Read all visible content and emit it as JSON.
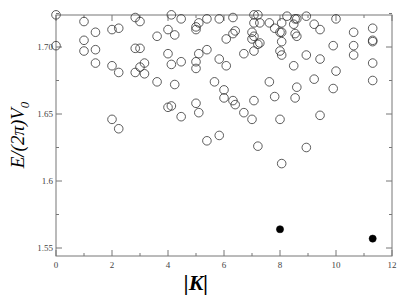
{
  "chart_data": {
    "type": "scatter",
    "title": "",
    "xlabel": "|K|",
    "ylabel": "E/(2π)V_0",
    "xlim": [
      0,
      12
    ],
    "ylim": [
      1.543,
      1.724
    ],
    "grid": false,
    "legend": null,
    "x_ticks": [
      0,
      2,
      4,
      6,
      8,
      10,
      12
    ],
    "x_tick_labels": [
      "0",
      "2",
      "4",
      "6",
      "8",
      "10",
      "12"
    ],
    "y_ticks": [
      1.55,
      1.6,
      1.65,
      1.7
    ],
    "y_tick_labels": [
      "1.55",
      "1.6",
      "1.65",
      "1.70"
    ],
    "series": [
      {
        "name": "open circles",
        "marker": "open-circle",
        "color": "#333333",
        "points": [
          [
            0.0,
            1.724
          ],
          [
            0.0,
            1.701
          ],
          [
            1.0,
            1.719
          ],
          [
            1.0,
            1.705
          ],
          [
            1.0,
            1.697
          ],
          [
            1.41,
            1.711
          ],
          [
            1.41,
            1.698
          ],
          [
            1.41,
            1.688
          ],
          [
            2.0,
            1.713
          ],
          [
            2.0,
            1.686
          ],
          [
            2.0,
            1.646
          ],
          [
            2.24,
            1.714
          ],
          [
            2.24,
            1.681
          ],
          [
            2.24,
            1.639
          ],
          [
            2.83,
            1.722
          ],
          [
            2.83,
            1.699
          ],
          [
            2.83,
            1.681
          ],
          [
            3.0,
            1.719
          ],
          [
            3.0,
            1.699
          ],
          [
            3.0,
            1.685
          ],
          [
            3.16,
            1.688
          ],
          [
            3.16,
            1.68
          ],
          [
            3.61,
            1.708
          ],
          [
            3.61,
            1.674
          ],
          [
            4.0,
            1.713
          ],
          [
            4.0,
            1.695
          ],
          [
            4.0,
            1.655
          ],
          [
            4.12,
            1.724
          ],
          [
            4.12,
            1.687
          ],
          [
            4.12,
            1.656
          ],
          [
            4.24,
            1.709
          ],
          [
            4.24,
            1.672
          ],
          [
            4.47,
            1.721
          ],
          [
            4.47,
            1.689
          ],
          [
            4.47,
            1.648
          ],
          [
            5.0,
            1.715
          ],
          [
            5.0,
            1.713
          ],
          [
            5.0,
            1.689
          ],
          [
            5.0,
            1.684
          ],
          [
            5.0,
            1.658
          ],
          [
            5.1,
            1.718
          ],
          [
            5.1,
            1.695
          ],
          [
            5.1,
            1.651
          ],
          [
            5.39,
            1.721
          ],
          [
            5.39,
            1.698
          ],
          [
            5.39,
            1.63
          ],
          [
            5.66,
            1.674
          ],
          [
            5.83,
            1.721
          ],
          [
            5.83,
            1.691
          ],
          [
            5.83,
            1.634
          ],
          [
            6.0,
            1.668
          ],
          [
            6.0,
            1.662
          ],
          [
            6.08,
            1.706
          ],
          [
            6.08,
            1.686
          ],
          [
            6.32,
            1.722
          ],
          [
            6.32,
            1.71
          ],
          [
            6.32,
            1.66
          ],
          [
            6.4,
            1.712
          ],
          [
            6.4,
            1.657
          ],
          [
            6.71,
            1.695
          ],
          [
            6.71,
            1.651
          ],
          [
            7.0,
            1.711
          ],
          [
            7.0,
            1.706
          ],
          [
            7.0,
            1.646
          ],
          [
            7.07,
            1.724
          ],
          [
            7.07,
            1.718
          ],
          [
            7.07,
            1.708
          ],
          [
            7.07,
            1.697
          ],
          [
            7.07,
            1.66
          ],
          [
            7.21,
            1.724
          ],
          [
            7.21,
            1.702
          ],
          [
            7.21,
            1.626
          ],
          [
            7.28,
            1.718
          ],
          [
            7.28,
            1.703
          ],
          [
            7.62,
            1.718
          ],
          [
            7.62,
            1.674
          ],
          [
            7.81,
            1.714
          ],
          [
            7.81,
            1.663
          ],
          [
            8.0,
            1.711
          ],
          [
            8.0,
            1.697
          ],
          [
            8.0,
            1.646
          ],
          [
            8.06,
            1.718
          ],
          [
            8.06,
            1.711
          ],
          [
            8.06,
            1.704
          ],
          [
            8.06,
            1.694
          ],
          [
            8.06,
            1.613
          ],
          [
            8.25,
            1.723
          ],
          [
            8.49,
            1.717
          ],
          [
            8.49,
            1.686
          ],
          [
            8.54,
            1.721
          ],
          [
            8.54,
            1.71
          ],
          [
            8.54,
            1.662
          ],
          [
            8.6,
            1.721
          ],
          [
            8.6,
            1.708
          ],
          [
            8.6,
            1.67
          ],
          [
            8.94,
            1.723
          ],
          [
            8.94,
            1.694
          ],
          [
            8.94,
            1.625
          ],
          [
            9.22,
            1.717
          ],
          [
            9.22,
            1.676
          ],
          [
            9.43,
            1.713
          ],
          [
            9.43,
            1.691
          ],
          [
            9.43,
            1.649
          ],
          [
            9.9,
            1.701
          ],
          [
            9.9,
            1.669
          ],
          [
            10.0,
            1.721
          ],
          [
            10.0,
            1.682
          ],
          [
            10.63,
            1.711
          ],
          [
            10.63,
            1.701
          ],
          [
            10.63,
            1.694
          ],
          [
            11.31,
            1.714
          ],
          [
            11.31,
            1.705
          ],
          [
            11.31,
            1.704
          ],
          [
            11.31,
            1.688
          ],
          [
            11.31,
            1.675
          ]
        ]
      },
      {
        "name": "filled circles",
        "marker": "filled-circle",
        "color": "#000000",
        "points": [
          [
            8.0,
            1.564
          ],
          [
            11.31,
            1.557
          ]
        ]
      }
    ]
  },
  "plot": {
    "x_label_main": "|K|",
    "y_label_main": "E/(2π)V",
    "y_label_sub": "0"
  }
}
